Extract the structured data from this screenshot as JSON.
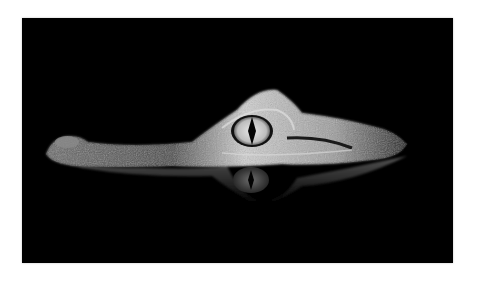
{
  "image": {
    "subject": "caiman head at water surface with reflection",
    "background_color": "#000000",
    "border_color": "#ffffff",
    "eye_color": "#d8d8d8",
    "pupil_color": "#050505"
  }
}
